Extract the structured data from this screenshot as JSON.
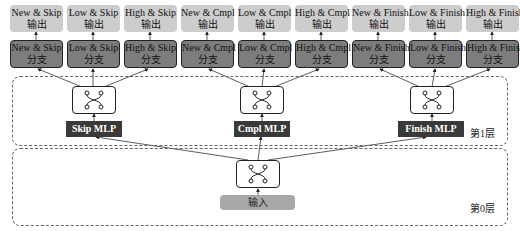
{
  "outputs": [
    {
      "line1": "New & Skip",
      "line2": "输出"
    },
    {
      "line1": "Low & Skip",
      "line2": "输出"
    },
    {
      "line1": "High & Skip",
      "line2": "输出"
    },
    {
      "line1": "New & Cmpl",
      "line2": "输出"
    },
    {
      "line1": "Low & Cmpl",
      "line2": "输出"
    },
    {
      "line1": "High & Cmpl",
      "line2": "输出"
    },
    {
      "line1": "New & Finish",
      "line2": "输出"
    },
    {
      "line1": "Low & Finish",
      "line2": "输出"
    },
    {
      "line1": "High & Finish",
      "line2": "输出"
    }
  ],
  "branches": [
    {
      "line1": "New & Skip",
      "line2": "分支"
    },
    {
      "line1": "Low & Skip",
      "line2": "分支"
    },
    {
      "line1": "High & Skip",
      "line2": "分支"
    },
    {
      "line1": "New & Cmpl",
      "line2": "分支"
    },
    {
      "line1": "Low & Cmpl",
      "line2": "分支"
    },
    {
      "line1": "High & Cmpl",
      "line2": "分支"
    },
    {
      "line1": "New & Finish",
      "line2": "分支"
    },
    {
      "line1": "Low & Finish",
      "line2": "分支"
    },
    {
      "line1": "High & Finish",
      "line2": "分支"
    }
  ],
  "layer1": {
    "label": "第1层",
    "mlps": [
      "Skip MLP",
      "Cmpl MLP",
      "Finish MLP"
    ]
  },
  "layer0": {
    "label": "第0层",
    "input": "输入"
  },
  "colors": {
    "output_fill": "#cdcdcd",
    "branch_fill": "#7d7d7d",
    "mlp_fill": "#3a3a3a",
    "input_fill": "#a8a8a8"
  }
}
